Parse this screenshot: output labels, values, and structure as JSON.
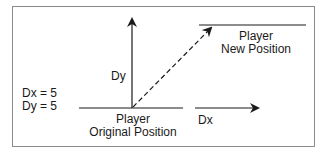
{
  "diagram": {
    "type": "motion-vector",
    "stroke_color": "#1a1a1a",
    "frame_color": "#8a8a8a",
    "labels": {
      "dx_value": "Dx = 5",
      "dy_value": "Dy = 5",
      "dy_axis": "Dy",
      "dx_axis": "Dx",
      "original_line1": "Player",
      "original_line2": "Original Position",
      "new_line1": "Player",
      "new_line2": "New Position"
    },
    "elements": {
      "original_position_line": {
        "x1": 79,
        "y1": 108,
        "x2": 183,
        "y2": 108
      },
      "new_position_line": {
        "x1": 199,
        "y1": 25,
        "x2": 306,
        "y2": 25
      },
      "dy_arrow": {
        "x1": 132,
        "y1": 108,
        "x2": 132,
        "y2": 18
      },
      "dx_arrow": {
        "x1": 195,
        "y1": 108,
        "x2": 259,
        "y2": 108
      },
      "movement_arrow": {
        "x1": 132,
        "y1": 108,
        "x2": 212,
        "y2": 27,
        "style": "dashed"
      }
    }
  }
}
